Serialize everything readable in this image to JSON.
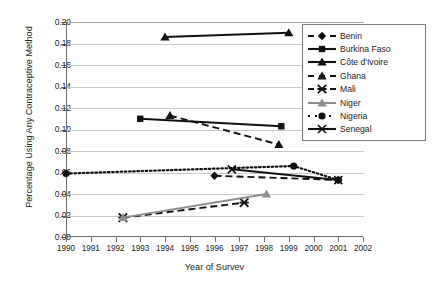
{
  "chart_data": {
    "type": "line",
    "title": "",
    "xlabel": "Year of Survev",
    "ylabel": "Percentage Using Any Contraceptive Method",
    "xlim": [
      1990,
      2002
    ],
    "ylim": [
      0.0,
      0.2
    ],
    "xticks": [
      "1990",
      "1991",
      "1992",
      "1993",
      "1994",
      "1995",
      "1996",
      "1997",
      "1998",
      "1999",
      "2000",
      "2001",
      "2002"
    ],
    "yticks": [
      "0.00",
      "0.02",
      "0.04",
      "0.06",
      "0.08",
      "0.10",
      "0.12",
      "0.14",
      "0.16",
      "0.18",
      "0.20"
    ],
    "grid": true,
    "legend_position": "upper-right-inside",
    "series": [
      {
        "name": "Benin",
        "marker": "diamond",
        "line_style": "dashed",
        "color": "#111111",
        "x": [
          1996,
          2001
        ],
        "values": [
          0.057,
          0.053
        ]
      },
      {
        "name": "Burkina Faso",
        "marker": "square",
        "line_style": "solid",
        "color": "#111111",
        "x": [
          1993,
          1998.7
        ],
        "values": [
          0.11,
          0.103
        ]
      },
      {
        "name": "Côte d'Ivoire",
        "marker": "triangle",
        "line_style": "solid",
        "color": "#111111",
        "x": [
          1994,
          1999
        ],
        "values": [
          0.186,
          0.19
        ]
      },
      {
        "name": "Ghana",
        "marker": "triangle",
        "line_style": "dashed",
        "color": "#111111",
        "x": [
          1994.2,
          1998.6
        ],
        "values": [
          0.113,
          0.086
        ]
      },
      {
        "name": "Mali",
        "marker": "star-x",
        "line_style": "dashed",
        "color": "#111111",
        "x": [
          1992.3,
          1997.2
        ],
        "values": [
          0.018,
          0.032
        ]
      },
      {
        "name": "Niger",
        "marker": "triangle",
        "line_style": "solid",
        "color": "#8d8d8d",
        "x": [
          1992.3,
          1998.1
        ],
        "values": [
          0.018,
          0.04
        ]
      },
      {
        "name": "Nigeria",
        "marker": "circle",
        "line_style": "dotted",
        "color": "#111111",
        "x": [
          1990,
          1999.2,
          2001
        ],
        "values": [
          0.059,
          0.066,
          0.053
        ]
      },
      {
        "name": "Senegal",
        "marker": "x",
        "line_style": "solid",
        "color": "#111111",
        "x": [
          1996.7,
          2001
        ],
        "values": [
          0.063,
          0.053
        ]
      }
    ]
  },
  "legend": {
    "entries": [
      {
        "label": "Benin"
      },
      {
        "label": "Burkina Faso"
      },
      {
        "label": "Côte d'Ivoire"
      },
      {
        "label": "Ghana"
      },
      {
        "label": "Mali"
      },
      {
        "label": "Niger"
      },
      {
        "label": "Nigeria"
      },
      {
        "label": "Senegal"
      }
    ]
  }
}
